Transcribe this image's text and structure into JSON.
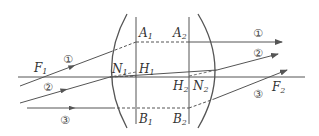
{
  "diagram": {
    "type": "thick-lens ray diagram",
    "colors": {
      "line": "#555555",
      "text": "#333333",
      "background": "#ffffff"
    },
    "labels": {
      "F1": "F",
      "F1_sub": "1",
      "F2": "F",
      "F2_sub": "2",
      "A1": "A",
      "A1_sub": "1",
      "A2": "A",
      "A2_sub": "2",
      "B1": "B",
      "B1_sub": "1",
      "B2": "B",
      "B2_sub": "2",
      "H1": "H",
      "H1_sub": "1",
      "H2": "H",
      "H2_sub": "2",
      "N1": "N",
      "N1_sub": "1",
      "N2": "N",
      "N2_sub": "2"
    },
    "rays": [
      {
        "id": "1",
        "label": "①",
        "left_label": "①",
        "right_label": "①",
        "description": "through F1, parallel after lens"
      },
      {
        "id": "2",
        "label": "②",
        "left_label": "②",
        "right_label": "②",
        "description": "toward N1, emerges parallel from N2"
      },
      {
        "id": "3",
        "label": "③",
        "left_label": "③",
        "right_label": "③",
        "description": "parallel to axis, passes through F2"
      }
    ],
    "elements": [
      "optical-axis",
      "left-lens-surface",
      "right-lens-surface",
      "principal-plane-H1",
      "principal-plane-H2"
    ]
  }
}
